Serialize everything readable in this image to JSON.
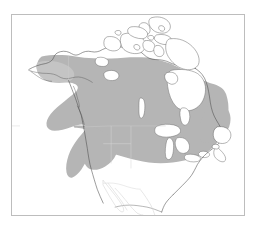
{
  "figure": {
    "kind": "range-map",
    "region": "North America",
    "title": "",
    "caption": "",
    "frame": {
      "border_color": "#bdbdbd",
      "background_color": "#ffffff",
      "x": 11,
      "y": 14,
      "width": 234,
      "height": 202
    },
    "legend": {
      "visible": false,
      "entries": [
        {
          "label": "Breeding / resident range",
          "color": "#b5b5b5",
          "swatch": "shaded-gray"
        },
        {
          "label": "Outside range",
          "color": "#ffffff",
          "swatch": "white"
        }
      ]
    },
    "layers": [
      {
        "name": "coastline",
        "stroke": "#4a4a4a",
        "fill": "none"
      },
      {
        "name": "political-borders",
        "stroke": "#c9c9c9",
        "fill": "none"
      },
      {
        "name": "species-range",
        "stroke": "none",
        "fill": "#b5b5b5"
      },
      {
        "name": "great-lakes",
        "stroke": "#6f6f6f",
        "fill": "#ffffff"
      },
      {
        "name": "arctic-archipelago",
        "stroke": "#555555",
        "fill": "#ffffff"
      }
    ],
    "annotations": [],
    "range_extent": {
      "north": "central Alaska and northern boreal Canada",
      "south": "mid-latitude United States",
      "west": "coastal Alaska and British Columbia",
      "east": "Atlantic coast and Maritime Canada"
    },
    "colors": {
      "range_gray": "#b5b5b5",
      "range_gray_soft": "#c4c4c4",
      "coast_stroke": "#4a4a4a",
      "border_stroke": "#c9c9c9",
      "frame_stroke": "#bdbdbd",
      "page_background": "#ffffff",
      "lake_fill": "#ffffff"
    }
  },
  "chart_data": {
    "type": "heatmap",
    "title": "",
    "xlabel": "",
    "ylabel": "",
    "grid": false,
    "legend_position": "none",
    "categories": [
      "Alaska (south & interior)",
      "Yukon",
      "British Columbia",
      "Northwest Territories (south)",
      "Alberta",
      "Saskatchewan",
      "Manitoba",
      "Ontario",
      "Quebec",
      "Labrador",
      "Maritimes",
      "Pacific Northwest US",
      "Northern Rockies US",
      "Great Lakes states",
      "Northeast US",
      "Mid-Atlantic US",
      "Great Plains (south)",
      "Southwest US",
      "Southeast US",
      "Mexico",
      "Canadian Arctic Archipelago",
      "Greenland"
    ],
    "values": [
      1,
      1,
      1,
      1,
      1,
      1,
      1,
      1,
      1,
      1,
      1,
      1,
      1,
      1,
      1,
      1,
      0,
      0,
      0,
      0,
      0,
      0
    ],
    "value_labels": {
      "1": "within range (shaded)",
      "0": "outside range (unshaded)"
    },
    "ylim": [
      0,
      1
    ]
  }
}
